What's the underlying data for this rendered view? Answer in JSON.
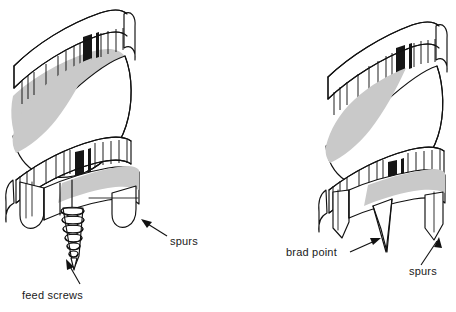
{
  "figure": {
    "background_color": "#ffffff",
    "ink_color": "#111111",
    "shade_color": "#c9c9c9",
    "dark_color": "#161616",
    "width": 456,
    "height": 312
  },
  "left_bit": {
    "name": "auger bit with feed screw",
    "callouts": [
      {
        "id": "feed-screws",
        "label": "feed screws",
        "text_x": 22,
        "text_y": 297,
        "leader_from": [
          75,
          286
        ],
        "leader_to": [
          100,
          258
        ]
      },
      {
        "id": "spurs",
        "label": "spurs",
        "text_x": 170,
        "text_y": 243,
        "leader_from": [
          166,
          236
        ],
        "leader_to": [
          139,
          219
        ]
      }
    ]
  },
  "right_bit": {
    "name": "brad point bit",
    "callouts": [
      {
        "id": "brad-point",
        "label": "brad point",
        "text_x": 286,
        "text_y": 255,
        "leader_from": [
          350,
          250
        ],
        "leader_to": [
          382,
          238
        ]
      },
      {
        "id": "spurs",
        "label": "spurs",
        "text_x": 409,
        "text_y": 273,
        "leader_from": [
          419,
          266
        ],
        "leader_to": [
          436,
          240
        ]
      }
    ]
  },
  "labels": {
    "feed_screws": "feed screws",
    "spurs_left": "spurs",
    "brad_point": "brad point",
    "spurs_right": "spurs"
  }
}
